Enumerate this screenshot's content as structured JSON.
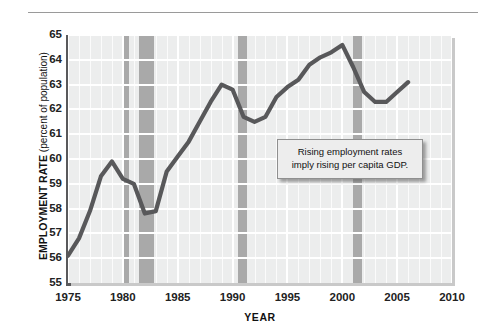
{
  "figure": {
    "y_axis_title_main": "EMPLOYMENT RATE",
    "y_axis_title_sub": "(percent of population)",
    "x_axis_title": "YEAR"
  },
  "annotation": {
    "line1": "Rising employment rates",
    "line2": "imply rising per capita GDP."
  },
  "colors": {
    "plot_background": "#eceded",
    "gridline": "#ffffff",
    "recession_band": "#a9a9a9",
    "data_line": "#58585a",
    "axis": "#59595b",
    "callout_background": "#ededed",
    "callout_border": "#8f8f8f"
  },
  "chart_data": {
    "type": "line",
    "title": "",
    "subtitle": "",
    "xlabel": "YEAR",
    "ylabel": "EMPLOYMENT RATE (percent of population)",
    "xlim": [
      1975,
      2010
    ],
    "ylim": [
      55,
      65
    ],
    "xticks": [
      1975,
      1980,
      1985,
      1990,
      1995,
      2000,
      2005,
      2010
    ],
    "yticks": [
      55,
      56,
      57,
      58,
      59,
      60,
      61,
      62,
      63,
      64,
      65
    ],
    "grid": true,
    "legend": "none",
    "x": [
      1975,
      1976,
      1977,
      1978,
      1979,
      1980,
      1981,
      1982,
      1983,
      1984,
      1985,
      1986,
      1987,
      1988,
      1989,
      1990,
      1991,
      1992,
      1993,
      1994,
      1995,
      1996,
      1997,
      1998,
      1999,
      2000,
      2001,
      2002,
      2003,
      2004,
      2005,
      2006
    ],
    "series": [
      {
        "name": "Employment rate",
        "values": [
          56.1,
          56.8,
          57.9,
          59.3,
          59.9,
          59.2,
          59.0,
          57.8,
          57.9,
          59.5,
          60.1,
          60.7,
          61.5,
          62.3,
          63.0,
          62.8,
          61.7,
          61.5,
          61.7,
          62.5,
          62.9,
          63.2,
          63.8,
          64.1,
          64.3,
          64.6,
          63.7,
          62.7,
          62.3,
          62.3,
          62.7,
          63.1
        ]
      }
    ],
    "recession_bands": [
      {
        "start": 1980.0,
        "end": 1980.6
      },
      {
        "start": 1981.5,
        "end": 1982.8
      },
      {
        "start": 1990.5,
        "end": 1991.3
      },
      {
        "start": 2001.0,
        "end": 2001.8
      }
    ],
    "annotations": [
      {
        "text": "Rising employment rates imply rising per capita GDP.",
        "x": 1997,
        "y": 60.6
      }
    ]
  }
}
